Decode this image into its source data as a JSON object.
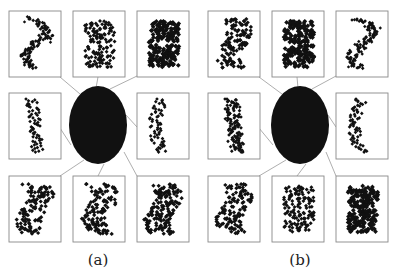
{
  "figure": {
    "panels": [
      {
        "id": "a",
        "caption": "(a)",
        "center_blob": "dark elliptical region (parameter set)",
        "thumbnails": [
          {
            "pos": "top-left",
            "shape": "dragon-curve-s"
          },
          {
            "pos": "top-center",
            "shape": "tiled-squares"
          },
          {
            "pos": "top-right",
            "shape": "dense-squares"
          },
          {
            "pos": "middle-left",
            "shape": "zigzag-strip"
          },
          {
            "pos": "middle-right",
            "shape": "curved-strip"
          },
          {
            "pos": "bottom-left",
            "shape": "dragon-cluster"
          },
          {
            "pos": "bottom-center",
            "shape": "dragon-cluster"
          },
          {
            "pos": "bottom-right",
            "shape": "dense-twist"
          }
        ]
      },
      {
        "id": "b",
        "caption": "(b)",
        "center_blob": "dark elliptical region (parameter set)",
        "thumbnails": [
          {
            "pos": "top-left",
            "shape": "dragon-cluster"
          },
          {
            "pos": "top-center",
            "shape": "solid-tile-holes"
          },
          {
            "pos": "top-right",
            "shape": "sparse-dragon"
          },
          {
            "pos": "middle-left",
            "shape": "twisted-strip"
          },
          {
            "pos": "middle-right",
            "shape": "curved-strip"
          },
          {
            "pos": "bottom-left",
            "shape": "twisted-cluster"
          },
          {
            "pos": "bottom-center",
            "shape": "loop-tiles"
          },
          {
            "pos": "bottom-right",
            "shape": "dense-loop-tiles"
          }
        ]
      }
    ],
    "colors": {
      "ink": "#111111",
      "frame": "#888888",
      "line": "#999999",
      "background": "#ffffff"
    }
  }
}
